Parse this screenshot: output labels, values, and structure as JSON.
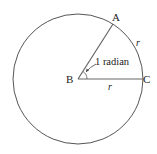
{
  "diagram": {
    "points": {
      "A": {
        "label": "A"
      },
      "B": {
        "label": "B"
      },
      "C": {
        "label": "C"
      }
    },
    "angle_label": "1 radian",
    "arc_label": "r",
    "radius_label": "r",
    "line_color": "#555555"
  }
}
